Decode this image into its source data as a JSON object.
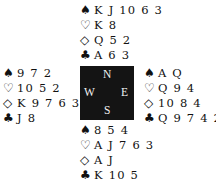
{
  "suits": {
    "spades": "♠",
    "hearts": "♡",
    "diamonds": "◇",
    "clubs": "♣"
  },
  "compass": {
    "north": "N",
    "south": "S",
    "east": "E",
    "west": "W"
  },
  "hands": {
    "north": {
      "spades": "K J 10 6 3",
      "hearts": "K 8",
      "diamonds": "Q 5 2",
      "clubs": "A 6 3"
    },
    "west": {
      "spades": "9 7 2",
      "hearts": "10 5 2",
      "diamonds": "K 9 7 6 3",
      "clubs": "J 8"
    },
    "east": {
      "spades": "A Q",
      "hearts": "Q 9 4",
      "diamonds": "10 8 4",
      "clubs": "Q 9 7 4 2"
    },
    "south": {
      "spades": "8 5 4",
      "hearts": "A J 7 6 3",
      "diamonds": "A J",
      "clubs": "K 10 5"
    }
  }
}
